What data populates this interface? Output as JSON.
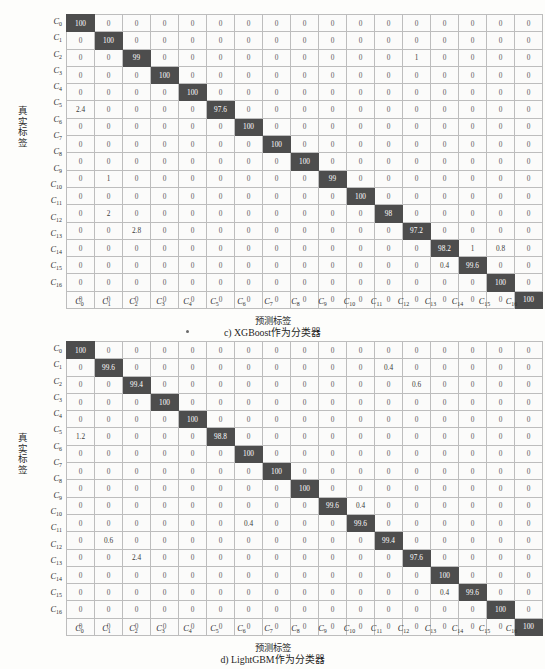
{
  "page": {
    "background_color": "#fdfdfb",
    "diag_cell_color": "#4d4d4d",
    "cell_bg_color": "#fbfbfa",
    "grid_line_color": "#bdbdbd"
  },
  "axis": {
    "ylabel": "真实标签",
    "ylabel_chars": [
      "真",
      "实",
      "标",
      "签"
    ],
    "xlabel": "预测标签",
    "class_labels": [
      "C0",
      "C1",
      "C2",
      "C3",
      "C4",
      "C5",
      "C6",
      "C7",
      "C8",
      "C9",
      "C10",
      "C11",
      "C12",
      "C13",
      "C14",
      "C15",
      "C16"
    ],
    "class_label_base": "C",
    "class_label_subs": [
      "0",
      "1",
      "2",
      "3",
      "4",
      "5",
      "6",
      "7",
      "8",
      "9",
      "10",
      "11",
      "12",
      "13",
      "14",
      "15",
      "16"
    ]
  },
  "figures": [
    {
      "id": "fig-c",
      "caption": "c) XGBoost作为分类器",
      "caption_prefix": "c) XGBoost",
      "caption_suffix": "作为分类器",
      "xlabel": "预测标签",
      "ylabel": "真实标签"
    },
    {
      "id": "fig-d",
      "caption": "d) LightGBM作为分类器",
      "caption_prefix": "d) LightGBM",
      "caption_suffix": "作为分类器",
      "xlabel": "预测标签",
      "ylabel": "真实标签"
    }
  ],
  "chart_data": [
    {
      "type": "heatmap",
      "subtype": "confusion-matrix",
      "title": "c) XGBoost作为分类器",
      "xlabel": "预测标签",
      "ylabel": "真实标签",
      "unit": "percent",
      "categories": [
        "C0",
        "C1",
        "C2",
        "C3",
        "C4",
        "C5",
        "C6",
        "C7",
        "C8",
        "C9",
        "C10",
        "C11",
        "C12",
        "C13",
        "C14",
        "C15",
        "C16"
      ],
      "x_tick_labels": [
        "C0",
        "C1",
        "C2",
        "C3",
        "C4",
        "C5",
        "C6",
        "C7",
        "C8",
        "C9",
        "C10",
        "C11",
        "C12",
        "C13",
        "C14",
        "C15",
        "C16"
      ],
      "y_tick_labels": [
        "C0",
        "C1",
        "C2",
        "C3",
        "C4",
        "C5",
        "C6",
        "C7",
        "C8",
        "C9",
        "C10",
        "C11",
        "C12",
        "C13",
        "C14",
        "C15",
        "C16"
      ],
      "legend": [],
      "grid": true,
      "values": [
        [
          "100",
          "0",
          "0",
          "0",
          "0",
          "0",
          "0",
          "0",
          "0",
          "0",
          "0",
          "0",
          "0",
          "0",
          "0",
          "0",
          "0"
        ],
        [
          "0",
          "100",
          "0",
          "0",
          "0",
          "0",
          "0",
          "0",
          "0",
          "0",
          "0",
          "0",
          "0",
          "0",
          "0",
          "0",
          "0"
        ],
        [
          "0",
          "0",
          "99",
          "0",
          "0",
          "0",
          "0",
          "0",
          "0",
          "0",
          "0",
          "0",
          "1",
          "0",
          "0",
          "0",
          "0"
        ],
        [
          "0",
          "0",
          "0",
          "100",
          "0",
          "0",
          "0",
          "0",
          "0",
          "0",
          "0",
          "0",
          "0",
          "0",
          "0",
          "0",
          "0"
        ],
        [
          "0",
          "0",
          "0",
          "0",
          "100",
          "0",
          "0",
          "0",
          "0",
          "0",
          "0",
          "0",
          "0",
          "0",
          "0",
          "0",
          "0"
        ],
        [
          "2.4",
          "0",
          "0",
          "0",
          "0",
          "97.6",
          "0",
          "0",
          "0",
          "0",
          "0",
          "0",
          "0",
          "0",
          "0",
          "0",
          "0"
        ],
        [
          "0",
          "0",
          "0",
          "0",
          "0",
          "0",
          "100",
          "0",
          "0",
          "0",
          "0",
          "0",
          "0",
          "0",
          "0",
          "0",
          "0"
        ],
        [
          "0",
          "0",
          "0",
          "0",
          "0",
          "0",
          "0",
          "100",
          "0",
          "0",
          "0",
          "0",
          "0",
          "0",
          "0",
          "0",
          "0"
        ],
        [
          "0",
          "0",
          "0",
          "0",
          "0",
          "0",
          "0",
          "0",
          "100",
          "0",
          "0",
          "0",
          "0",
          "0",
          "0",
          "0",
          "0"
        ],
        [
          "0",
          "1",
          "0",
          "0",
          "0",
          "0",
          "0",
          "0",
          "0",
          "99",
          "0",
          "0",
          "0",
          "0",
          "0",
          "0",
          "0"
        ],
        [
          "0",
          "0",
          "0",
          "0",
          "0",
          "0",
          "0",
          "0",
          "0",
          "0",
          "100",
          "0",
          "0",
          "0",
          "0",
          "0",
          "0"
        ],
        [
          "0",
          "2",
          "0",
          "0",
          "0",
          "0",
          "0",
          "0",
          "0",
          "0",
          "0",
          "98",
          "0",
          "0",
          "0",
          "0",
          "0"
        ],
        [
          "0",
          "0",
          "2.8",
          "0",
          "0",
          "0",
          "0",
          "0",
          "0",
          "0",
          "0",
          "0",
          "97.2",
          "0",
          "0",
          "0",
          "0"
        ],
        [
          "0",
          "0",
          "0",
          "0",
          "0",
          "0",
          "0",
          "0",
          "0",
          "0",
          "0",
          "0",
          "0",
          "98.2",
          "1",
          "0.8",
          "0"
        ],
        [
          "0",
          "0",
          "0",
          "0",
          "0",
          "0",
          "0",
          "0",
          "0",
          "0",
          "0",
          "0",
          "0",
          "0.4",
          "99.6",
          "0",
          "0"
        ],
        [
          "0",
          "0",
          "0",
          "0",
          "0",
          "0",
          "0",
          "0",
          "0",
          "0",
          "0",
          "0",
          "0",
          "0",
          "0",
          "100",
          "0"
        ],
        [
          "0",
          "0",
          "0",
          "0",
          "0",
          "0",
          "0",
          "0",
          "0",
          "0",
          "0",
          "0",
          "0",
          "0",
          "0",
          "0",
          "100"
        ]
      ]
    },
    {
      "type": "heatmap",
      "subtype": "confusion-matrix",
      "title": "d) LightGBM作为分类器",
      "xlabel": "预测标签",
      "ylabel": "真实标签",
      "unit": "percent",
      "categories": [
        "C0",
        "C1",
        "C2",
        "C3",
        "C4",
        "C5",
        "C6",
        "C7",
        "C8",
        "C9",
        "C10",
        "C11",
        "C12",
        "C13",
        "C14",
        "C15",
        "C16"
      ],
      "x_tick_labels": [
        "C0",
        "C1",
        "C2",
        "C3",
        "C4",
        "C5",
        "C6",
        "C7",
        "C8",
        "C9",
        "C10",
        "C11",
        "C12",
        "C13",
        "C14",
        "C15",
        "C16"
      ],
      "y_tick_labels": [
        "C0",
        "C1",
        "C2",
        "C3",
        "C4",
        "C5",
        "C6",
        "C7",
        "C8",
        "C9",
        "C10",
        "C11",
        "C12",
        "C13",
        "C14",
        "C15",
        "C16"
      ],
      "legend": [],
      "grid": true,
      "values": [
        [
          "100",
          "0",
          "0",
          "0",
          "0",
          "0",
          "0",
          "0",
          "0",
          "0",
          "0",
          "0",
          "0",
          "0",
          "0",
          "0",
          "0"
        ],
        [
          "0",
          "99.6",
          "0",
          "0",
          "0",
          "0",
          "0",
          "0",
          "0",
          "0",
          "0",
          "0.4",
          "0",
          "0",
          "0",
          "0",
          "0"
        ],
        [
          "0",
          "0",
          "99.4",
          "0",
          "0",
          "0",
          "0",
          "0",
          "0",
          "0",
          "0",
          "0",
          "0.6",
          "0",
          "0",
          "0",
          "0"
        ],
        [
          "0",
          "0",
          "0",
          "100",
          "0",
          "0",
          "0",
          "0",
          "0",
          "0",
          "0",
          "0",
          "0",
          "0",
          "0",
          "0",
          "0"
        ],
        [
          "0",
          "0",
          "0",
          "0",
          "100",
          "0",
          "0",
          "0",
          "0",
          "0",
          "0",
          "0",
          "0",
          "0",
          "0",
          "0",
          "0"
        ],
        [
          "1.2",
          "0",
          "0",
          "0",
          "0",
          "98.8",
          "0",
          "0",
          "0",
          "0",
          "0",
          "0",
          "0",
          "0",
          "0",
          "0",
          "0"
        ],
        [
          "0",
          "0",
          "0",
          "0",
          "0",
          "0",
          "100",
          "0",
          "0",
          "0",
          "0",
          "0",
          "0",
          "0",
          "0",
          "0",
          "0"
        ],
        [
          "0",
          "0",
          "0",
          "0",
          "0",
          "0",
          "0",
          "100",
          "0",
          "0",
          "0",
          "0",
          "0",
          "0",
          "0",
          "0",
          "0"
        ],
        [
          "0",
          "0",
          "0",
          "0",
          "0",
          "0",
          "0",
          "0",
          "100",
          "0",
          "0",
          "0",
          "0",
          "0",
          "0",
          "0",
          "0"
        ],
        [
          "0",
          "0",
          "0",
          "0",
          "0",
          "0",
          "0",
          "0",
          "0",
          "99.6",
          "0.4",
          "0",
          "0",
          "0",
          "0",
          "0",
          "0"
        ],
        [
          "0",
          "0",
          "0",
          "0",
          "0",
          "0",
          "0.4",
          "0",
          "0",
          "0",
          "99.6",
          "0",
          "0",
          "0",
          "0",
          "0",
          "0"
        ],
        [
          "0",
          "0.6",
          "0",
          "0",
          "0",
          "0",
          "0",
          "0",
          "0",
          "0",
          "0",
          "99.4",
          "0",
          "0",
          "0",
          "0",
          "0"
        ],
        [
          "0",
          "0",
          "2.4",
          "0",
          "0",
          "0",
          "0",
          "0",
          "0",
          "0",
          "0",
          "0",
          "97.6",
          "0",
          "0",
          "0",
          "0"
        ],
        [
          "0",
          "0",
          "0",
          "0",
          "0",
          "0",
          "0",
          "0",
          "0",
          "0",
          "0",
          "0",
          "0",
          "100",
          "0",
          "0",
          "0"
        ],
        [
          "0",
          "0",
          "0",
          "0",
          "0",
          "0",
          "0",
          "0",
          "0",
          "0",
          "0",
          "0",
          "0",
          "0.4",
          "99.6",
          "0",
          "0"
        ],
        [
          "0",
          "0",
          "0",
          "0",
          "0",
          "0",
          "0",
          "0",
          "0",
          "0",
          "0",
          "0",
          "0",
          "0",
          "0",
          "100",
          "0"
        ],
        [
          "0",
          "0",
          "0",
          "0",
          "0",
          "0",
          "0",
          "0",
          "0",
          "0",
          "0",
          "0",
          "0",
          "0",
          "0",
          "0",
          "100"
        ]
      ]
    }
  ]
}
